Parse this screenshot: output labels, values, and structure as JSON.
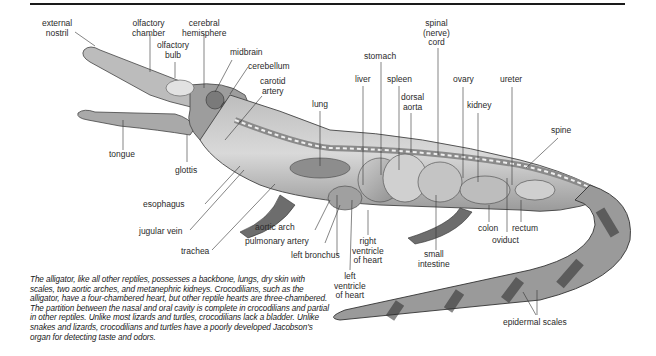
{
  "diagram": {
    "labels": {
      "external_nostril": "external\nnostril",
      "olfactory_chamber": "olfactory\nchamber",
      "cerebral_hemisphere": "cerebral\nhemisphere",
      "olfactory_bulb": "olfactory\nbulb",
      "midbrain": "midbrain",
      "cerebellum": "cerebellum",
      "carotid_artery": "carotid\nartery",
      "lung": "lung",
      "liver": "liver",
      "stomach": "stomach",
      "spleen": "spleen",
      "dorsal_aorta": "dorsal\naorta",
      "spinal_cord": "spinal\n(nerve)\ncord",
      "ovary": "ovary",
      "kidney": "kidney",
      "ureter": "ureter",
      "spine": "spine",
      "tongue": "tongue",
      "glottis": "glottis",
      "esophagus": "esophagus",
      "jugular_vein": "jugular vein",
      "trachea": "trachea",
      "aortic_arch": "aortic arch",
      "pulmonary_artery": "pulmonary artery",
      "left_bronchus": "left bronchus",
      "right_ventricle": "right\nventricle\nof heart",
      "left_ventricle": "left\nventricle\nof heart",
      "small_intestine": "small\nintestine",
      "colon": "colon",
      "rectum": "rectum",
      "oviduct": "oviduct",
      "epidermal_scales": "epidermal scales"
    },
    "caption": "The alligator, like all other reptiles, possesses a backbone, lungs, dry skin with scales, two aortic arches, and metanephric kidneys. Crocodilians, such as the alligator, have a four-chambered heart, but other reptile hearts are three-chambered. The partition between the nasal and oral cavity is complete in crocodilians and partial in other reptiles. Unlike most lizards and turtles, crocodilians lack a bladder. Unlike snakes and lizards, crocodilians and turtles have a poorly developed Jacobson's organ for detecting taste and odors."
  }
}
